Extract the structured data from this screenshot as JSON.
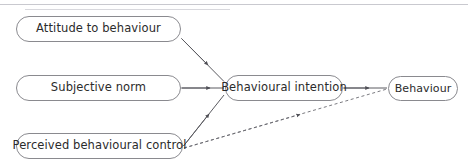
{
  "diagram": {
    "type": "flow-diagram",
    "colors": {
      "node_border": "#8a8a8f",
      "node_fill": "#ffffff",
      "edge": "#5a5a60",
      "text": "#2b2b2b",
      "scan_line": "#c9c9cf"
    },
    "nodes": [
      {
        "id": "attitude",
        "label": "Attitude to behaviour"
      },
      {
        "id": "subjective",
        "label": "Subjective norm"
      },
      {
        "id": "pbc",
        "label": "Perceived behavioural control"
      },
      {
        "id": "intention",
        "label": "Behavioural intention"
      },
      {
        "id": "behaviour",
        "label": "Behaviour"
      }
    ],
    "edges": [
      {
        "id": "attitude-to-intention",
        "from": "attitude",
        "to": "intention",
        "style": "solid",
        "arrow": "single"
      },
      {
        "id": "subjective-to-intention",
        "from": "subjective",
        "to": "intention",
        "style": "solid",
        "arrow": "single"
      },
      {
        "id": "pbc-to-intention",
        "from": "pbc",
        "to": "intention",
        "style": "solid",
        "arrow": "single"
      },
      {
        "id": "intention-to-behaviour",
        "from": "intention",
        "to": "behaviour",
        "style": "solid",
        "arrow": "single"
      },
      {
        "id": "pbc-to-behaviour",
        "from": "pbc",
        "to": "behaviour",
        "style": "dashed",
        "arrow": "single"
      }
    ]
  }
}
